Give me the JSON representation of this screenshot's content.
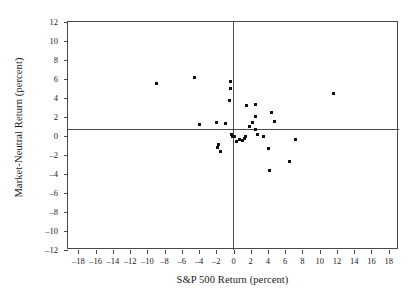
{
  "chart_data": {
    "type": "scatter",
    "title": "",
    "xlabel": "S&P 500 Return (percent)",
    "ylabel": "Market-Neutral Return (percent)",
    "xlim": [
      -19.2,
      19.2
    ],
    "ylim": [
      -12.0,
      12.0
    ],
    "xticks": [
      -18,
      -16,
      -14,
      -12,
      -10,
      -8,
      -6,
      -4,
      -2,
      0,
      2,
      4,
      6,
      8,
      10,
      12,
      14,
      16,
      18
    ],
    "yticks": [
      -12,
      -10,
      -8,
      -6,
      -4,
      -2,
      0,
      2,
      4,
      6,
      8,
      10,
      12
    ],
    "xticklabels": [
      "–18",
      "–16",
      "–14",
      "–12",
      "–10",
      "–8",
      "–6",
      "–4",
      "–2",
      "0",
      "2",
      "4",
      "6",
      "8",
      "10",
      "12",
      "14",
      "16",
      "18"
    ],
    "yticklabels": [
      "–12",
      "–10",
      "–8",
      "–6",
      "–4",
      "–2",
      "0",
      "2",
      "4",
      "6",
      "8",
      "10",
      "12"
    ],
    "grid": false,
    "legend": false,
    "zero_lines": {
      "x": 0,
      "y": 0
    },
    "marker": {
      "shape": "square",
      "color": "#111111",
      "size": 3
    },
    "n_points": 34,
    "points": [
      {
        "x": -8.9,
        "y": 5.5
      },
      {
        "x": -4.5,
        "y": 6.2
      },
      {
        "x": -3.9,
        "y": 1.2
      },
      {
        "x": -2.0,
        "y": 1.4
      },
      {
        "x": -1.7,
        "y": -0.9
      },
      {
        "x": -1.8,
        "y": -1.2
      },
      {
        "x": -1.5,
        "y": -1.6
      },
      {
        "x": -0.9,
        "y": 1.3
      },
      {
        "x": -0.35,
        "y": 5.7
      },
      {
        "x": -0.4,
        "y": 5.0
      },
      {
        "x": -0.5,
        "y": 3.7
      },
      {
        "x": -0.25,
        "y": 0.15
      },
      {
        "x": -0.15,
        "y": -0.05
      },
      {
        "x": 0.15,
        "y": -0.1
      },
      {
        "x": 0.4,
        "y": -0.6
      },
      {
        "x": 0.75,
        "y": -0.4
      },
      {
        "x": 1.0,
        "y": -0.45
      },
      {
        "x": 1.25,
        "y": -0.3
      },
      {
        "x": 1.45,
        "y": -0.05
      },
      {
        "x": 1.5,
        "y": 3.25
      },
      {
        "x": 1.9,
        "y": 1.05
      },
      {
        "x": 2.2,
        "y": 1.4
      },
      {
        "x": 2.6,
        "y": 3.3
      },
      {
        "x": 2.6,
        "y": 2.1
      },
      {
        "x": 2.5,
        "y": 0.65
      },
      {
        "x": 2.8,
        "y": 0.2
      },
      {
        "x": 3.5,
        "y": -0.05
      },
      {
        "x": 4.1,
        "y": -1.35
      },
      {
        "x": 4.2,
        "y": -3.6
      },
      {
        "x": 4.4,
        "y": 2.45
      },
      {
        "x": 4.8,
        "y": 1.5
      },
      {
        "x": 6.5,
        "y": -2.7
      },
      {
        "x": 7.2,
        "y": -0.4
      },
      {
        "x": 11.6,
        "y": 4.5
      }
    ]
  }
}
